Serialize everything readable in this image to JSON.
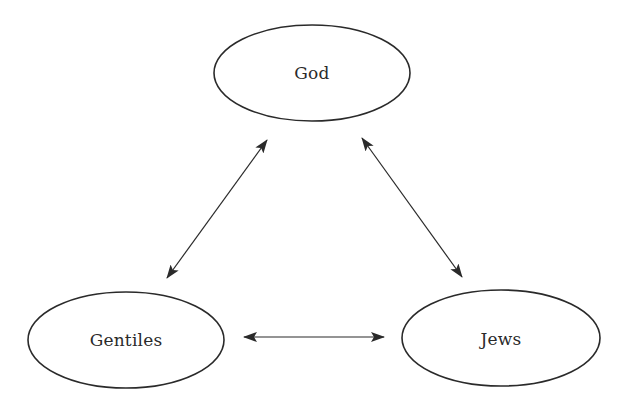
{
  "diagram": {
    "type": "relationship-triangle",
    "colors": {
      "stroke": "#2a2a2a",
      "text": "#2a2a2a",
      "background": "#ffffff"
    },
    "nodes": [
      {
        "id": "god",
        "label": "God",
        "cx": 312,
        "cy": 73,
        "rx": 98,
        "ry": 48
      },
      {
        "id": "gentiles",
        "label": "Gentiles",
        "cx": 126,
        "cy": 340,
        "rx": 98,
        "ry": 48
      },
      {
        "id": "jews",
        "label": "Jews",
        "cx": 501,
        "cy": 338,
        "rx": 99,
        "ry": 48
      }
    ],
    "edges": [
      {
        "from": "god",
        "to": "gentiles",
        "bidirectional": true
      },
      {
        "from": "god",
        "to": "jews",
        "bidirectional": true
      },
      {
        "from": "gentiles",
        "to": "jews",
        "bidirectional": true
      }
    ]
  }
}
